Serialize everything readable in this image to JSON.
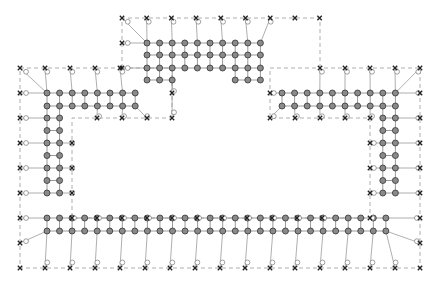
{
  "diagram": {
    "type": "mesh-graph",
    "width": 443,
    "height": 286,
    "colors": {
      "node_fill": "#8a8a8a",
      "node_stroke": "#333333",
      "edge": "#9a9a9a",
      "boundary": "#999999",
      "ghost_node": "#ffffff",
      "ghost_stroke": "#777777",
      "marker": "#222222"
    },
    "grid": {
      "x0": 47,
      "dx": 12.55,
      "y0": 43,
      "dy": 12.55
    },
    "regions": [
      {
        "name": "top-block",
        "cols": [
          8,
          17
        ],
        "rows": [
          0,
          3
        ]
      },
      {
        "name": "left-arm",
        "cols": [
          0,
          7
        ],
        "rows": [
          4,
          5
        ]
      },
      {
        "name": "right-arm",
        "cols": [
          20,
          29
        ],
        "rows": [
          4,
          5
        ]
      },
      {
        "name": "left-column",
        "cols": [
          0,
          1
        ],
        "rows": [
          6,
          13
        ]
      },
      {
        "name": "right-column",
        "cols": [
          28,
          29
        ],
        "rows": [
          6,
          13
        ]
      },
      {
        "name": "bottom-bar",
        "cols": [
          0,
          29
        ],
        "rows": [
          14,
          15
        ]
      }
    ],
    "boundary_outline": [
      [
        122,
        18
      ],
      [
        320,
        18
      ],
      [
        320,
        68
      ],
      [
        420,
        68
      ],
      [
        420,
        268
      ],
      [
        20,
        268
      ],
      [
        20,
        68
      ],
      [
        122,
        68
      ]
    ],
    "inner_outline": [
      [
        84,
        118
      ],
      [
        84,
        218
      ],
      [
        370,
        218
      ],
      [
        370,
        118
      ],
      [
        270,
        118
      ],
      [
        270,
        93
      ],
      [
        175,
        93
      ],
      [
        175,
        118
      ]
    ]
  }
}
